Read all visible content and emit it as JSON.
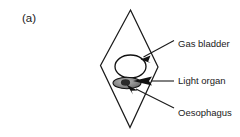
{
  "figure": {
    "panel_label": "(a)",
    "background_color": "#ffffff",
    "line_color": "#1a1a1a",
    "text_color": "#1a1a1a"
  },
  "diagram": {
    "type": "anatomical-schematic",
    "subject_outline_name": "fish-body-outline-rhombus",
    "outline_shape": "rhombus",
    "organs": [
      {
        "name": "gas-bladder",
        "shape": "ellipse",
        "fill": "#ffffff",
        "outline": "#111111"
      },
      {
        "name": "light-organ",
        "shape": "ellipse",
        "fill": "#7a7a7a",
        "outline": "#111111"
      }
    ]
  },
  "callouts": [
    {
      "id": "gas-bladder",
      "label": "Gas bladder",
      "arrow_direction": "down-left"
    },
    {
      "id": "light-organ",
      "label": "Light organ",
      "arrow_direction": "left"
    },
    {
      "id": "oesophagus",
      "label": "Oesophagus",
      "arrow_direction": "up-left"
    }
  ]
}
